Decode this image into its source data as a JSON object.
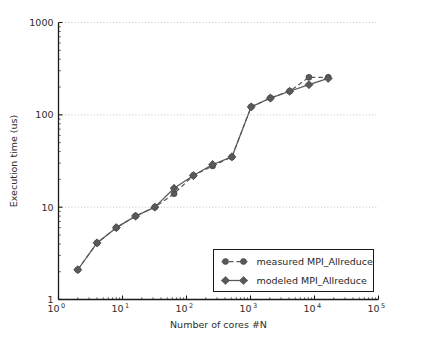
{
  "chart_data": {
    "type": "line",
    "title": "",
    "xlabel": "Number of cores #N",
    "ylabel": "Execution time (us)",
    "xscale": "log",
    "yscale": "log",
    "xlim": [
      1,
      100000
    ],
    "ylim": [
      1,
      1000
    ],
    "grid": true,
    "grid_axis": "y",
    "legend_position": "lower right",
    "xtick_labels": [
      "10",
      "10",
      "10",
      "10",
      "10",
      "10"
    ],
    "xtick_exponents": [
      "0",
      "1",
      "2",
      "3",
      "4",
      "5"
    ],
    "xtick_values": [
      1,
      10,
      100,
      1000,
      10000,
      100000
    ],
    "ytick_labels": [
      "1",
      "10",
      "100",
      "1000"
    ],
    "ytick_values": [
      1,
      10,
      100,
      1000
    ],
    "series": [
      {
        "name": "measured MPI_Allreduce",
        "marker": "circle",
        "linestyle": "dashed",
        "color": "#595959",
        "x": [
          2,
          4,
          8,
          16,
          32,
          64,
          128,
          256,
          512,
          1024,
          2048,
          4096,
          8192,
          16384
        ],
        "y": [
          2.1,
          4.1,
          6.0,
          8.0,
          10.0,
          14.0,
          22.0,
          28.0,
          35.0,
          122.0,
          152.0,
          180.0,
          255.0,
          255.0
        ]
      },
      {
        "name": "modeled MPI_Allreduce",
        "marker": "diamond",
        "linestyle": "solid",
        "color": "#595959",
        "x": [
          2,
          4,
          8,
          16,
          32,
          64,
          128,
          256,
          512,
          1024,
          2048,
          4096,
          8192,
          16384
        ],
        "y": [
          2.1,
          4.1,
          6.0,
          8.0,
          10.0,
          16.0,
          22.0,
          29.0,
          35.0,
          122.0,
          152.0,
          180.0,
          212.0,
          248.0
        ]
      }
    ]
  },
  "legend": {
    "entries": [
      {
        "label": "measured MPI_Allreduce"
      },
      {
        "label": "modeled MPI_Allreduce"
      }
    ]
  },
  "axes": {
    "x_title": "Number of cores #N",
    "y_title": "Execution time (us)"
  },
  "colors": {
    "line": "#595959",
    "marker": "#5a5a5a",
    "axis": "#1a1a1a",
    "grid": "#b4b4b4",
    "background": "#ffffff"
  }
}
